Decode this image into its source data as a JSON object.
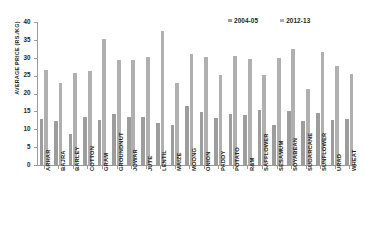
{
  "chart_data": {
    "type": "bar",
    "title": "",
    "xlabel": "",
    "ylabel": "AVERAGE PRICE (RS./KG)",
    "ylim": [
      0,
      40
    ],
    "yticks": [
      0,
      5,
      10,
      15,
      20,
      25,
      30,
      35,
      40
    ],
    "grid": false,
    "legend_position": "top-right",
    "categories": [
      "ARHAR",
      "BAJRA",
      "BARLEY",
      "COTTON",
      "GRAM",
      "GROUNDNUT",
      "JOWAR",
      "JUTE",
      "LENTIL",
      "MAIZE",
      "MOONG",
      "ONION",
      "PADDY",
      "POTATO",
      "R&M",
      "SAFFLOWER",
      "SESAMUM",
      "SOYABEAN",
      "SUGARCANE",
      "SUNFLOWER",
      "URAD",
      "WHEAT"
    ],
    "series": [
      {
        "name": "2004-05",
        "color": "#9d9d9d",
        "values": [
          12.8,
          12.2,
          8.8,
          13.5,
          12.7,
          14.2,
          13.5,
          13.4,
          11.8,
          11.3,
          16.5,
          14.7,
          13.1,
          14.4,
          14.0,
          15.4,
          11.3,
          15.0,
          12.4,
          14.5,
          12.7,
          12.9
        ]
      },
      {
        "name": "2012-13",
        "color": "#b0b0b0",
        "values": [
          26.5,
          23.0,
          25.7,
          26.4,
          35.2,
          29.5,
          29.3,
          30.3,
          37.6,
          22.9,
          31.1,
          30.3,
          25.3,
          30.5,
          29.6,
          25.1,
          29.9,
          32.4,
          21.3,
          31.5,
          27.8,
          25.5
        ]
      }
    ]
  },
  "axis": {
    "y_label": "AVERAGE PRICE (RS./KG)",
    "y_tick_labels": [
      "0",
      "5",
      "10",
      "15",
      "20",
      "25",
      "30",
      "35",
      "40"
    ]
  },
  "legend": {
    "items": [
      {
        "label": "2004-05",
        "swatch": "legend-swatch-2004-05"
      },
      {
        "label": "2012-13",
        "swatch": "legend-swatch-2012-13"
      }
    ]
  }
}
